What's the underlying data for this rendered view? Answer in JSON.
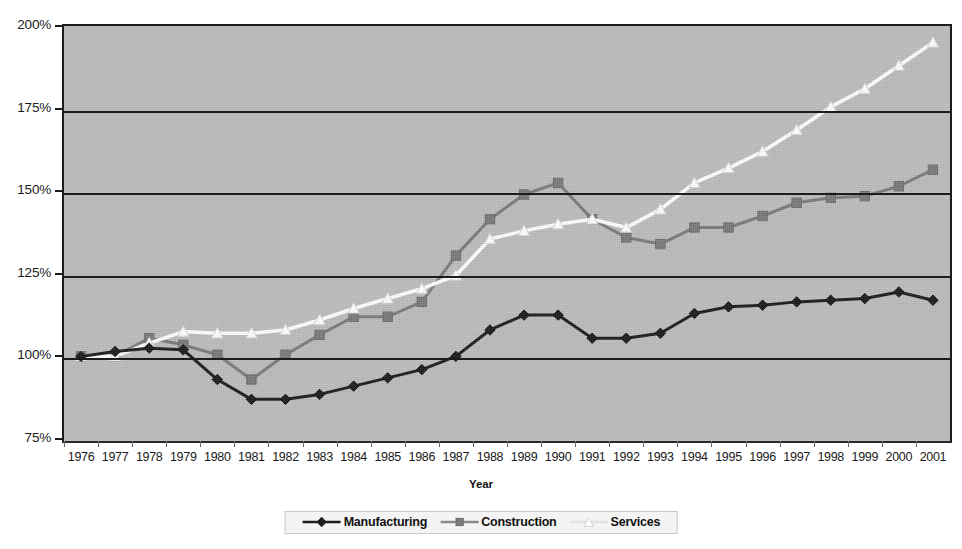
{
  "chart_data": {
    "type": "line",
    "title": "",
    "xlabel": "Year",
    "ylabel": "",
    "xlim": [
      1976,
      2001
    ],
    "ylim": [
      75,
      200
    ],
    "ytick_labels": [
      "200%",
      "175%",
      "150%",
      "125%",
      "100%",
      "75%"
    ],
    "ytick_values": [
      200,
      175,
      150,
      125,
      100,
      75
    ],
    "grid": true,
    "grid_axis": "y",
    "legend_position": "bottom-center",
    "categories": [
      1976,
      1977,
      1978,
      1979,
      1980,
      1981,
      1982,
      1983,
      1984,
      1985,
      1986,
      1987,
      1988,
      1989,
      1990,
      1991,
      1992,
      1993,
      1994,
      1995,
      1996,
      1997,
      1998,
      1999,
      2000,
      2001
    ],
    "xtick_labels": [
      "1976",
      "1977",
      "1978",
      "1979",
      "1980",
      "1981",
      "1982",
      "1983",
      "1984",
      "1985",
      "1986",
      "1987",
      "1988",
      "1989",
      "1990",
      "1991",
      "1992",
      "1993",
      "1994",
      "1995",
      "1996",
      "1997",
      "1998",
      "1999",
      "2000",
      "2001"
    ],
    "series": [
      {
        "name": "Manufacturing",
        "color": "#1c1c1c",
        "marker": "diamond",
        "marker_fill": "#1c1c1c",
        "values": [
          100.0,
          101.5,
          102.5,
          102.0,
          93.0,
          87.0,
          87.0,
          88.5,
          91.0,
          93.5,
          96.0,
          100.0,
          108.0,
          112.5,
          112.5,
          105.5,
          105.5,
          107.0,
          113.0,
          115.0,
          115.5,
          116.5,
          117.0,
          117.5,
          119.5,
          117.0
        ]
      },
      {
        "name": "Construction",
        "color": "#7b7b7b",
        "marker": "square",
        "marker_fill": "#7b7b7b",
        "values": [
          100.0,
          100.0,
          105.5,
          103.5,
          100.5,
          93.0,
          100.5,
          106.5,
          112.0,
          112.0,
          116.5,
          130.5,
          141.5,
          149.0,
          152.5,
          141.5,
          136.0,
          134.0,
          139.0,
          139.0,
          142.5,
          146.5,
          148.0,
          148.5,
          151.5,
          156.5
        ]
      },
      {
        "name": "Services",
        "color": "#ffffff",
        "marker": "triangle",
        "marker_fill": "#ffffff",
        "values": [
          100.0,
          100.0,
          104.0,
          107.5,
          107.0,
          107.0,
          108.0,
          111.0,
          114.5,
          117.5,
          120.5,
          124.5,
          135.5,
          138.0,
          140.0,
          141.5,
          139.0,
          144.5,
          152.5,
          157.0,
          162.0,
          168.5,
          175.5,
          181.0,
          188.0,
          195.0
        ]
      }
    ]
  },
  "legend": {
    "items": [
      {
        "label": "Manufacturing"
      },
      {
        "label": "Construction"
      },
      {
        "label": "Services"
      }
    ]
  },
  "axis": {
    "x_title": "Year"
  }
}
